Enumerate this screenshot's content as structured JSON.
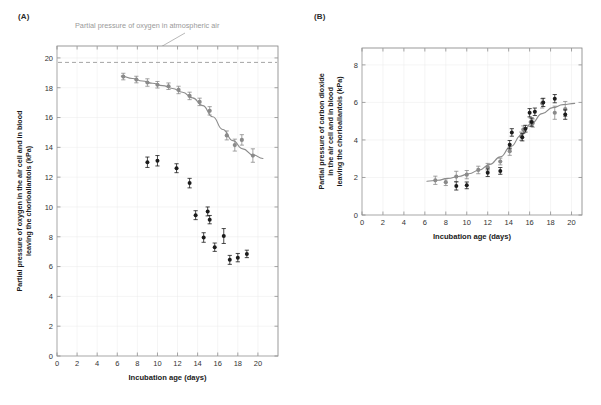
{
  "figure": {
    "panels": [
      {
        "id": "A",
        "label": "(A)",
        "annotation": "Partial pressure of oxygen in atmospheric air"
      },
      {
        "id": "B",
        "label": "(B)"
      }
    ]
  },
  "chart_data": [
    {
      "type": "scatter",
      "panel": "(A)",
      "title": "",
      "xlabel": "Incubation age (days)",
      "ylabel": "Partial pressure of oxygen in the air cell and in blood leaving the chorioallantois (kPa)",
      "xlim": [
        0,
        22
      ],
      "ylim": [
        0,
        20.8
      ],
      "xticks": [
        0,
        2,
        4,
        6,
        8,
        10,
        12,
        14,
        16,
        18,
        20
      ],
      "yticks": [
        0,
        2,
        4,
        6,
        8,
        10,
        12,
        14,
        16,
        18,
        20
      ],
      "grid": true,
      "legend": "none",
      "annotations": [
        {
          "text": "Partial pressure of oxygen in atmospheric air",
          "x": 12.0,
          "y": 19.7,
          "color": "#9a9a9a"
        }
      ],
      "reference_lines": [
        {
          "name": "atmospheric-oxygen-line",
          "orientation": "horizontal",
          "y": 19.7,
          "style": "dashed",
          "color": "#9a9a9a"
        }
      ],
      "series": [
        {
          "name": "air-cell-oxygen",
          "color": "#8a8a8a",
          "marker": "circle",
          "has_fit_curve": true,
          "points": [
            {
              "x": 6.6,
              "y": 18.75,
              "err": 0.22
            },
            {
              "x": 7.9,
              "y": 18.55,
              "err": 0.22
            },
            {
              "x": 9.0,
              "y": 18.35,
              "err": 0.25
            },
            {
              "x": 10.0,
              "y": 18.2,
              "err": 0.22
            },
            {
              "x": 11.1,
              "y": 18.1,
              "err": 0.22
            },
            {
              "x": 12.1,
              "y": 17.85,
              "err": 0.25
            },
            {
              "x": 13.2,
              "y": 17.45,
              "err": 0.25
            },
            {
              "x": 14.2,
              "y": 17.05,
              "err": 0.25
            },
            {
              "x": 15.2,
              "y": 16.45,
              "err": 0.28
            },
            {
              "x": 16.9,
              "y": 14.8,
              "err": 0.3
            },
            {
              "x": 17.7,
              "y": 14.15,
              "err": 0.4
            },
            {
              "x": 18.4,
              "y": 14.5,
              "err": 0.35
            },
            {
              "x": 19.5,
              "y": 13.45,
              "err": 0.45
            }
          ]
        },
        {
          "name": "blood-oxygen",
          "color": "#1c1c1c",
          "marker": "circle",
          "has_fit_curve": false,
          "points": [
            {
              "x": 9.0,
              "y": 13.0,
              "err": 0.35
            },
            {
              "x": 10.0,
              "y": 13.1,
              "err": 0.35
            },
            {
              "x": 11.9,
              "y": 12.6,
              "err": 0.3
            },
            {
              "x": 13.2,
              "y": 11.6,
              "err": 0.32
            },
            {
              "x": 13.8,
              "y": 9.45,
              "err": 0.3
            },
            {
              "x": 15.0,
              "y": 9.7,
              "err": 0.3
            },
            {
              "x": 15.2,
              "y": 9.15,
              "err": 0.28
            },
            {
              "x": 14.6,
              "y": 7.95,
              "err": 0.32
            },
            {
              "x": 15.7,
              "y": 7.3,
              "err": 0.28
            },
            {
              "x": 16.6,
              "y": 8.05,
              "err": 0.5
            },
            {
              "x": 17.2,
              "y": 6.45,
              "err": 0.3
            },
            {
              "x": 18.0,
              "y": 6.6,
              "err": 0.28
            },
            {
              "x": 18.9,
              "y": 6.85,
              "err": 0.25
            }
          ]
        }
      ],
      "fit_curve": {
        "name": "oxygen-sigmoid-fit",
        "color": "#8c8c8c",
        "points": [
          {
            "x": 6.4,
            "y": 18.78
          },
          {
            "x": 7.5,
            "y": 18.62
          },
          {
            "x": 8.5,
            "y": 18.45
          },
          {
            "x": 9.5,
            "y": 18.3
          },
          {
            "x": 10.5,
            "y": 18.14
          },
          {
            "x": 11.5,
            "y": 17.95
          },
          {
            "x": 12.5,
            "y": 17.7
          },
          {
            "x": 13.5,
            "y": 17.32
          },
          {
            "x": 14.5,
            "y": 16.8
          },
          {
            "x": 15.5,
            "y": 16.05
          },
          {
            "x": 16.5,
            "y": 15.2
          },
          {
            "x": 17.5,
            "y": 14.45
          },
          {
            "x": 18.5,
            "y": 13.9
          },
          {
            "x": 19.5,
            "y": 13.5
          },
          {
            "x": 20.5,
            "y": 13.25
          }
        ]
      }
    },
    {
      "type": "scatter",
      "panel": "(B)",
      "title": "",
      "xlabel": "Incubation age (days)",
      "ylabel": "Partial pressure of carbon dioxide in the air cell and in blood leaving the chorioallantois (kPa)",
      "xlim": [
        0,
        21
      ],
      "ylim": [
        0,
        8.9
      ],
      "xticks": [
        0,
        2,
        4,
        6,
        8,
        10,
        12,
        14,
        16,
        18,
        20
      ],
      "yticks": [
        0,
        2,
        4,
        6,
        8
      ],
      "grid": true,
      "legend": "none",
      "annotations": [],
      "reference_lines": [],
      "series": [
        {
          "name": "air-cell-carbon-dioxide",
          "color": "#8a8a8a",
          "marker": "circle",
          "has_fit_curve": true,
          "points": [
            {
              "x": 7.0,
              "y": 1.85,
              "err": 0.22
            },
            {
              "x": 8.0,
              "y": 1.75,
              "err": 0.18
            },
            {
              "x": 9.0,
              "y": 2.05,
              "err": 0.28
            },
            {
              "x": 10.0,
              "y": 2.15,
              "err": 0.22
            },
            {
              "x": 11.1,
              "y": 2.4,
              "err": 0.2
            },
            {
              "x": 12.0,
              "y": 2.55,
              "err": 0.2
            },
            {
              "x": 13.2,
              "y": 2.85,
              "err": 0.18
            },
            {
              "x": 14.1,
              "y": 3.4,
              "err": 0.22
            },
            {
              "x": 15.2,
              "y": 4.2,
              "err": 0.22
            },
            {
              "x": 15.4,
              "y": 4.55,
              "err": 0.2
            },
            {
              "x": 16.1,
              "y": 4.95,
              "err": 0.22
            },
            {
              "x": 16.3,
              "y": 4.9,
              "err": 0.22
            },
            {
              "x": 17.2,
              "y": 5.95,
              "err": 0.25
            },
            {
              "x": 18.4,
              "y": 5.45,
              "err": 0.35
            },
            {
              "x": 19.4,
              "y": 5.65,
              "err": 0.4
            }
          ]
        },
        {
          "name": "blood-carbon-dioxide",
          "color": "#1c1c1c",
          "marker": "circle",
          "has_fit_curve": false,
          "points": [
            {
              "x": 9.0,
              "y": 1.55,
              "err": 0.22
            },
            {
              "x": 10.0,
              "y": 1.58,
              "err": 0.18
            },
            {
              "x": 12.0,
              "y": 2.25,
              "err": 0.2
            },
            {
              "x": 13.2,
              "y": 2.35,
              "err": 0.18
            },
            {
              "x": 14.1,
              "y": 3.75,
              "err": 0.22
            },
            {
              "x": 14.3,
              "y": 4.4,
              "err": 0.2
            },
            {
              "x": 15.3,
              "y": 4.15,
              "err": 0.2
            },
            {
              "x": 15.6,
              "y": 4.6,
              "err": 0.18
            },
            {
              "x": 16.0,
              "y": 5.45,
              "err": 0.22
            },
            {
              "x": 16.2,
              "y": 4.95,
              "err": 0.22
            },
            {
              "x": 16.5,
              "y": 5.5,
              "err": 0.2
            },
            {
              "x": 17.3,
              "y": 6.0,
              "err": 0.22
            },
            {
              "x": 18.4,
              "y": 6.2,
              "err": 0.22
            },
            {
              "x": 19.4,
              "y": 5.35,
              "err": 0.25
            }
          ]
        }
      ],
      "fit_curve": {
        "name": "carbon-dioxide-sigmoid-fit",
        "color": "#8c8c8c",
        "points": [
          {
            "x": 6.2,
            "y": 1.8
          },
          {
            "x": 7.2,
            "y": 1.85
          },
          {
            "x": 8.2,
            "y": 1.95
          },
          {
            "x": 9.2,
            "y": 2.05
          },
          {
            "x": 10.2,
            "y": 2.2
          },
          {
            "x": 11.2,
            "y": 2.4
          },
          {
            "x": 12.2,
            "y": 2.7
          },
          {
            "x": 13.2,
            "y": 3.1
          },
          {
            "x": 14.2,
            "y": 3.65
          },
          {
            "x": 15.2,
            "y": 4.25
          },
          {
            "x": 16.2,
            "y": 4.9
          },
          {
            "x": 17.2,
            "y": 5.4
          },
          {
            "x": 18.2,
            "y": 5.72
          },
          {
            "x": 19.2,
            "y": 5.88
          },
          {
            "x": 20.3,
            "y": 5.95
          }
        ]
      }
    }
  ]
}
